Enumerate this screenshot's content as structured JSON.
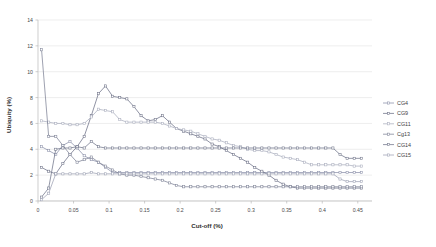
{
  "chart_data": {
    "type": "line",
    "title": "",
    "xlabel": "Cut-off (%)",
    "ylabel": "Ubiquity (%)",
    "xlim": [
      0,
      0.47
    ],
    "ylim": [
      0,
      14
    ],
    "xticks": [
      0,
      0.05,
      0.1,
      0.15,
      0.2,
      0.25,
      0.3,
      0.35,
      0.4,
      0.45
    ],
    "xticklabels": [
      "0",
      "0.05",
      "0.1",
      "0.15",
      "0.2",
      "0.25",
      "0.3",
      "0.35",
      "0.4",
      "0.45"
    ],
    "yticks": [
      0,
      2,
      4,
      6,
      8,
      10,
      12,
      14
    ],
    "yticklabels": [
      "0",
      "2",
      "4",
      "6",
      "8",
      "10",
      "12",
      "14"
    ],
    "grid": "horizontal",
    "legend_position": "right",
    "markers": "square",
    "series": [
      {
        "name": "CG4",
        "color": "#8a8fa8",
        "points": [
          [
            0.005,
            4.2
          ],
          [
            0.015,
            3.9
          ],
          [
            0.025,
            3.6
          ],
          [
            0.035,
            4.3
          ],
          [
            0.045,
            4.6
          ],
          [
            0.055,
            4.1
          ],
          [
            0.065,
            3.5
          ],
          [
            0.075,
            3.2
          ],
          [
            0.085,
            3.0
          ],
          [
            0.095,
            2.6
          ],
          [
            0.105,
            2.2
          ],
          [
            0.115,
            2.2
          ],
          [
            0.125,
            2.2
          ],
          [
            0.135,
            2.2
          ],
          [
            0.145,
            2.2
          ],
          [
            0.155,
            2.2
          ],
          [
            0.165,
            2.2
          ],
          [
            0.175,
            2.2
          ],
          [
            0.185,
            2.2
          ],
          [
            0.195,
            2.2
          ],
          [
            0.205,
            2.2
          ],
          [
            0.215,
            2.2
          ],
          [
            0.225,
            2.2
          ],
          [
            0.235,
            2.2
          ],
          [
            0.245,
            2.2
          ],
          [
            0.255,
            2.2
          ],
          [
            0.265,
            2.2
          ],
          [
            0.275,
            2.2
          ],
          [
            0.285,
            2.2
          ],
          [
            0.295,
            2.2
          ],
          [
            0.305,
            2.2
          ],
          [
            0.315,
            2.2
          ],
          [
            0.325,
            2.2
          ],
          [
            0.335,
            2.2
          ],
          [
            0.345,
            2.2
          ],
          [
            0.355,
            2.2
          ],
          [
            0.365,
            2.2
          ],
          [
            0.375,
            2.2
          ],
          [
            0.385,
            2.2
          ],
          [
            0.395,
            2.2
          ],
          [
            0.405,
            2.2
          ],
          [
            0.415,
            2.2
          ],
          [
            0.425,
            2.2
          ],
          [
            0.435,
            2.2
          ],
          [
            0.445,
            2.2
          ],
          [
            0.455,
            2.2
          ]
        ]
      },
      {
        "name": "CG9",
        "color": "#6b6f85",
        "points": [
          [
            0.005,
            2.6
          ],
          [
            0.015,
            2.3
          ],
          [
            0.025,
            2.1
          ],
          [
            0.035,
            2.9
          ],
          [
            0.045,
            3.6
          ],
          [
            0.055,
            4.2
          ],
          [
            0.065,
            5.0
          ],
          [
            0.075,
            6.6
          ],
          [
            0.085,
            8.3
          ],
          [
            0.095,
            8.9
          ],
          [
            0.105,
            8.1
          ],
          [
            0.115,
            8.0
          ],
          [
            0.125,
            7.9
          ],
          [
            0.135,
            7.3
          ],
          [
            0.145,
            6.6
          ],
          [
            0.155,
            6.2
          ],
          [
            0.165,
            6.3
          ],
          [
            0.175,
            6.6
          ],
          [
            0.185,
            6.1
          ],
          [
            0.195,
            5.6
          ],
          [
            0.205,
            5.4
          ],
          [
            0.215,
            5.2
          ],
          [
            0.225,
            5.0
          ],
          [
            0.235,
            4.8
          ],
          [
            0.245,
            4.4
          ],
          [
            0.255,
            4.2
          ],
          [
            0.265,
            3.9
          ],
          [
            0.275,
            3.6
          ],
          [
            0.285,
            3.3
          ],
          [
            0.295,
            3.0
          ],
          [
            0.305,
            2.6
          ],
          [
            0.315,
            2.3
          ],
          [
            0.325,
            2.0
          ],
          [
            0.335,
            1.6
          ],
          [
            0.345,
            1.3
          ],
          [
            0.355,
            1.1
          ],
          [
            0.365,
            1.0
          ],
          [
            0.375,
            1.0
          ],
          [
            0.385,
            1.0
          ],
          [
            0.395,
            1.0
          ],
          [
            0.405,
            1.0
          ],
          [
            0.415,
            1.0
          ],
          [
            0.425,
            1.0
          ],
          [
            0.435,
            1.0
          ],
          [
            0.445,
            1.0
          ],
          [
            0.455,
            1.0
          ]
        ]
      },
      {
        "name": "CG11",
        "color": "#a9adbd",
        "points": [
          [
            0.005,
            6.2
          ],
          [
            0.015,
            6.1
          ],
          [
            0.025,
            6.0
          ],
          [
            0.035,
            6.0
          ],
          [
            0.045,
            5.9
          ],
          [
            0.055,
            5.9
          ],
          [
            0.065,
            6.0
          ],
          [
            0.075,
            6.5
          ],
          [
            0.085,
            7.1
          ],
          [
            0.095,
            7.0
          ],
          [
            0.105,
            6.9
          ],
          [
            0.115,
            6.3
          ],
          [
            0.125,
            6.1
          ],
          [
            0.135,
            6.1
          ],
          [
            0.145,
            6.1
          ],
          [
            0.155,
            6.1
          ],
          [
            0.165,
            6.1
          ],
          [
            0.175,
            6.0
          ],
          [
            0.185,
            5.8
          ],
          [
            0.195,
            5.6
          ],
          [
            0.205,
            5.5
          ],
          [
            0.215,
            5.4
          ],
          [
            0.225,
            5.2
          ],
          [
            0.235,
            5.0
          ],
          [
            0.245,
            4.8
          ],
          [
            0.255,
            4.7
          ],
          [
            0.265,
            4.5
          ],
          [
            0.275,
            4.3
          ],
          [
            0.285,
            4.2
          ],
          [
            0.295,
            4.0
          ],
          [
            0.305,
            3.9
          ],
          [
            0.315,
            3.9
          ],
          [
            0.325,
            3.8
          ],
          [
            0.335,
            3.6
          ],
          [
            0.345,
            3.4
          ],
          [
            0.355,
            3.3
          ],
          [
            0.365,
            3.2
          ],
          [
            0.375,
            3.0
          ],
          [
            0.385,
            2.8
          ],
          [
            0.395,
            2.8
          ],
          [
            0.405,
            2.8
          ],
          [
            0.415,
            2.8
          ],
          [
            0.425,
            2.8
          ],
          [
            0.435,
            2.8
          ],
          [
            0.445,
            2.7
          ],
          [
            0.455,
            2.7
          ]
        ]
      },
      {
        "name": "Cg13",
        "color": "#7d8296",
        "points": [
          [
            0.005,
            11.7
          ],
          [
            0.015,
            5.0
          ],
          [
            0.025,
            5.0
          ],
          [
            0.035,
            4.3
          ],
          [
            0.045,
            3.6
          ],
          [
            0.055,
            3.0
          ],
          [
            0.065,
            3.2
          ],
          [
            0.075,
            3.4
          ],
          [
            0.085,
            3.0
          ],
          [
            0.095,
            2.7
          ],
          [
            0.105,
            2.4
          ],
          [
            0.115,
            2.1
          ],
          [
            0.125,
            2.0
          ],
          [
            0.135,
            2.0
          ],
          [
            0.145,
            1.9
          ],
          [
            0.155,
            1.8
          ],
          [
            0.165,
            1.7
          ],
          [
            0.175,
            1.6
          ],
          [
            0.185,
            1.4
          ],
          [
            0.195,
            1.2
          ],
          [
            0.205,
            1.1
          ],
          [
            0.215,
            1.1
          ],
          [
            0.225,
            1.1
          ],
          [
            0.235,
            1.1
          ],
          [
            0.245,
            1.1
          ],
          [
            0.255,
            1.1
          ],
          [
            0.265,
            1.1
          ],
          [
            0.275,
            1.1
          ],
          [
            0.285,
            1.1
          ],
          [
            0.295,
            1.1
          ],
          [
            0.305,
            1.1
          ],
          [
            0.315,
            1.1
          ],
          [
            0.325,
            1.1
          ],
          [
            0.335,
            1.1
          ],
          [
            0.345,
            1.1
          ],
          [
            0.355,
            1.1
          ],
          [
            0.365,
            1.1
          ],
          [
            0.375,
            1.1
          ],
          [
            0.385,
            1.1
          ],
          [
            0.395,
            1.1
          ],
          [
            0.405,
            1.1
          ],
          [
            0.415,
            1.1
          ],
          [
            0.425,
            1.1
          ],
          [
            0.435,
            1.1
          ],
          [
            0.445,
            1.1
          ],
          [
            0.455,
            1.1
          ]
        ]
      },
      {
        "name": "CG14",
        "color": "#6f7489",
        "points": [
          [
            0.005,
            0.3
          ],
          [
            0.015,
            1.0
          ],
          [
            0.025,
            4.0
          ],
          [
            0.035,
            4.1
          ],
          [
            0.045,
            4.1
          ],
          [
            0.055,
            4.2
          ],
          [
            0.065,
            4.1
          ],
          [
            0.075,
            4.6
          ],
          [
            0.085,
            4.2
          ],
          [
            0.095,
            4.1
          ],
          [
            0.105,
            4.1
          ],
          [
            0.115,
            4.1
          ],
          [
            0.125,
            4.1
          ],
          [
            0.135,
            4.1
          ],
          [
            0.145,
            4.1
          ],
          [
            0.155,
            4.1
          ],
          [
            0.165,
            4.1
          ],
          [
            0.175,
            4.1
          ],
          [
            0.185,
            4.1
          ],
          [
            0.195,
            4.1
          ],
          [
            0.205,
            4.1
          ],
          [
            0.215,
            4.1
          ],
          [
            0.225,
            4.1
          ],
          [
            0.235,
            4.1
          ],
          [
            0.245,
            4.1
          ],
          [
            0.255,
            4.1
          ],
          [
            0.265,
            4.1
          ],
          [
            0.275,
            4.1
          ],
          [
            0.285,
            4.1
          ],
          [
            0.295,
            4.1
          ],
          [
            0.305,
            4.1
          ],
          [
            0.315,
            4.1
          ],
          [
            0.325,
            4.1
          ],
          [
            0.335,
            4.1
          ],
          [
            0.345,
            4.1
          ],
          [
            0.355,
            4.1
          ],
          [
            0.365,
            4.1
          ],
          [
            0.375,
            4.1
          ],
          [
            0.385,
            4.1
          ],
          [
            0.395,
            4.1
          ],
          [
            0.405,
            4.1
          ],
          [
            0.415,
            4.1
          ],
          [
            0.425,
            3.6
          ],
          [
            0.435,
            3.3
          ],
          [
            0.445,
            3.3
          ],
          [
            0.455,
            3.3
          ]
        ]
      },
      {
        "name": "CG15",
        "color": "#9da2b4",
        "points": [
          [
            0.005,
            0.1
          ],
          [
            0.015,
            0.6
          ],
          [
            0.025,
            2.1
          ],
          [
            0.035,
            2.1
          ],
          [
            0.045,
            2.1
          ],
          [
            0.055,
            2.1
          ],
          [
            0.065,
            2.1
          ],
          [
            0.075,
            2.2
          ],
          [
            0.085,
            2.1
          ],
          [
            0.095,
            2.1
          ],
          [
            0.105,
            2.1
          ],
          [
            0.115,
            2.1
          ],
          [
            0.125,
            2.1
          ],
          [
            0.135,
            2.1
          ],
          [
            0.145,
            2.1
          ],
          [
            0.155,
            2.1
          ],
          [
            0.165,
            2.1
          ],
          [
            0.175,
            2.1
          ],
          [
            0.185,
            2.1
          ],
          [
            0.195,
            2.1
          ],
          [
            0.205,
            2.1
          ],
          [
            0.215,
            2.1
          ],
          [
            0.225,
            2.1
          ],
          [
            0.235,
            2.1
          ],
          [
            0.245,
            2.1
          ],
          [
            0.255,
            2.1
          ],
          [
            0.265,
            2.1
          ],
          [
            0.275,
            2.1
          ],
          [
            0.285,
            2.1
          ],
          [
            0.295,
            2.1
          ],
          [
            0.305,
            2.1
          ],
          [
            0.315,
            2.1
          ],
          [
            0.325,
            2.1
          ],
          [
            0.335,
            2.1
          ],
          [
            0.345,
            2.1
          ],
          [
            0.355,
            2.1
          ],
          [
            0.365,
            2.1
          ],
          [
            0.375,
            2.1
          ],
          [
            0.385,
            2.1
          ],
          [
            0.395,
            2.1
          ],
          [
            0.405,
            2.1
          ],
          [
            0.415,
            2.1
          ],
          [
            0.425,
            1.7
          ],
          [
            0.435,
            1.5
          ],
          [
            0.445,
            1.5
          ],
          [
            0.455,
            1.5
          ]
        ]
      }
    ]
  },
  "legend": {
    "entries": [
      {
        "label": "CG4"
      },
      {
        "label": "CG9"
      },
      {
        "label": "CG11"
      },
      {
        "label": "Cg13"
      },
      {
        "label": "CG14"
      },
      {
        "label": "CG15"
      }
    ]
  }
}
